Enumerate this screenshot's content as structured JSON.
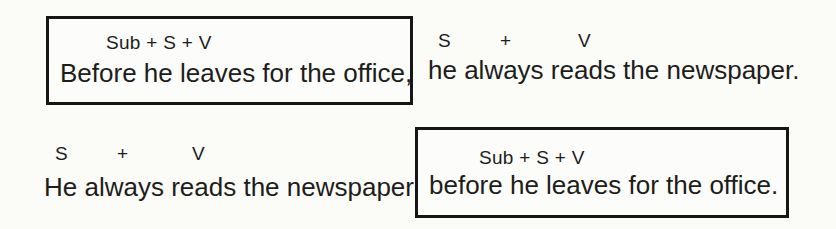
{
  "page": {
    "background": "#fbfbf8",
    "ink": "#1d1d1b",
    "box_border_color": "#161614"
  },
  "diagram": {
    "rows": [
      {
        "left": {
          "boxed": true,
          "formula": "Sub + S + V",
          "sentence": "Before he leaves for the office,"
        },
        "right": {
          "boxed": false,
          "formula": [
            "S",
            "+",
            "V"
          ],
          "sentence": "he always reads the newspaper."
        }
      },
      {
        "left": {
          "boxed": false,
          "formula": [
            "S",
            "+",
            "V"
          ],
          "sentence": "He always reads the newspaper"
        },
        "right": {
          "boxed": true,
          "formula": "Sub + S + V",
          "sentence": "before he leaves for the office."
        }
      }
    ]
  }
}
